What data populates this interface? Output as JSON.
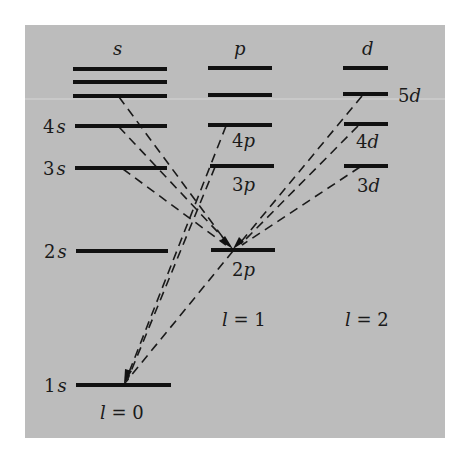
{
  "diagram": {
    "columns": [
      {
        "id": "s",
        "header": "s",
        "l_label": "l = 0"
      },
      {
        "id": "p",
        "header": "p",
        "l_label": "l = 1"
      },
      {
        "id": "d",
        "header": "d",
        "l_label": "l = 2"
      }
    ],
    "levels": [
      {
        "id": "s_top1",
        "column": "s",
        "label": ""
      },
      {
        "id": "s_top2",
        "column": "s",
        "label": ""
      },
      {
        "id": "5s",
        "column": "s",
        "label": ""
      },
      {
        "id": "4s",
        "column": "s",
        "label": "4s"
      },
      {
        "id": "3s",
        "column": "s",
        "label": "3s"
      },
      {
        "id": "2s",
        "column": "s",
        "label": "2s"
      },
      {
        "id": "1s",
        "column": "s",
        "label": "1s"
      },
      {
        "id": "p_top",
        "column": "p",
        "label": ""
      },
      {
        "id": "5p",
        "column": "p",
        "label": ""
      },
      {
        "id": "4p",
        "column": "p",
        "label": "4p"
      },
      {
        "id": "3p",
        "column": "p",
        "label": "3p"
      },
      {
        "id": "2p",
        "column": "p",
        "label": "2p"
      },
      {
        "id": "d_top",
        "column": "d",
        "label": ""
      },
      {
        "id": "5d",
        "column": "d",
        "label": "5d"
      },
      {
        "id": "4d",
        "column": "d",
        "label": "4d"
      },
      {
        "id": "3d",
        "column": "d",
        "label": "3d"
      }
    ],
    "transitions": [
      {
        "from": "5s",
        "to": "2p"
      },
      {
        "from": "4s",
        "to": "2p"
      },
      {
        "from": "3s",
        "to": "2p"
      },
      {
        "from": "5d",
        "to": "2p"
      },
      {
        "from": "4d",
        "to": "2p"
      },
      {
        "from": "3d",
        "to": "2p"
      },
      {
        "from": "4p",
        "to": "1s"
      },
      {
        "from": "3p",
        "to": "1s"
      },
      {
        "from": "2p",
        "to": "1s"
      }
    ],
    "labels": {
      "s": "s",
      "p": "p",
      "d": "d",
      "n4s": "4",
      "n3s": "3",
      "n2s": "2",
      "n1s": "1",
      "sym_s": "s",
      "n4p": "4",
      "n3p": "3",
      "n2p": "2",
      "sym_p": "p",
      "n5d": "5",
      "n4d": "4",
      "n3d": "3",
      "sym_d": "d",
      "l0": "l",
      "l0_val": " = 0",
      "l1": "l",
      "l1_val": " = 1",
      "l2": "l",
      "l2_val": " =  2"
    }
  }
}
